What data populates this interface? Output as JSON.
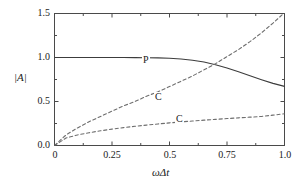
{
  "chart_data": {
    "type": "line",
    "title": "",
    "xlabel": "ωΔt",
    "ylabel": "|A|",
    "xlim": [
      0,
      1.0
    ],
    "ylim": [
      0,
      1.5
    ],
    "grid": false,
    "legend_position": "inline-labels",
    "xticks": [
      "0",
      "0.25",
      "0.5",
      "0.75",
      "1.0"
    ],
    "xtick_values": [
      0,
      0.25,
      0.5,
      0.75,
      1.0
    ],
    "yticks": [
      "0.0",
      "0.5",
      "1.0",
      "1.5"
    ],
    "ytick_values": [
      0.0,
      0.5,
      1.0,
      1.5
    ],
    "minor_tick_step_x": 0.125,
    "minor_tick_step_y": 0.25,
    "x": [
      0.0,
      0.05,
      0.1,
      0.15,
      0.2,
      0.25,
      0.3,
      0.35,
      0.4,
      0.45,
      0.5,
      0.55,
      0.6,
      0.65,
      0.7,
      0.75,
      0.8,
      0.85,
      0.9,
      0.95,
      1.0
    ],
    "series": [
      {
        "name": "P",
        "label": "P",
        "style": "solid",
        "color": "#3c3c3c",
        "label_x": 0.42,
        "label_y": 1.0,
        "values": [
          1.0,
          1.0,
          1.0,
          1.0,
          1.0,
          1.0,
          1.0,
          0.999,
          0.998,
          0.996,
          0.991,
          0.983,
          0.969,
          0.948,
          0.918,
          0.881,
          0.838,
          0.793,
          0.748,
          0.706,
          0.672
        ]
      },
      {
        "name": "C-upper",
        "label": "C",
        "style": "dashed",
        "color": "#6e6e6e",
        "label_x": 0.47,
        "label_y": 0.66,
        "values": [
          0.0,
          0.12,
          0.2,
          0.27,
          0.33,
          0.39,
          0.45,
          0.5,
          0.56,
          0.61,
          0.67,
          0.73,
          0.79,
          0.86,
          0.93,
          1.01,
          1.09,
          1.18,
          1.28,
          1.39,
          1.51
        ]
      },
      {
        "name": "C-lower",
        "label": "C",
        "style": "dashed",
        "color": "#6e6e6e",
        "label_x": 0.56,
        "label_y": 0.3,
        "values": [
          0.0,
          0.085,
          0.12,
          0.145,
          0.167,
          0.186,
          0.203,
          0.218,
          0.232,
          0.245,
          0.257,
          0.268,
          0.278,
          0.288,
          0.297,
          0.306,
          0.314,
          0.322,
          0.33,
          0.345,
          0.36
        ]
      }
    ]
  },
  "axes": {
    "frame_color": "#4a4a4a",
    "background": "#ffffff"
  }
}
